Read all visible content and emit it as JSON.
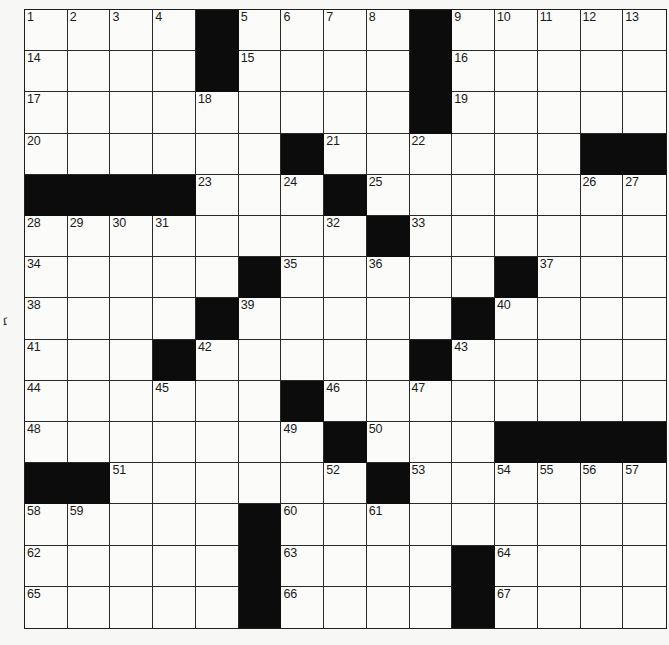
{
  "puzzle": {
    "type": "crossword",
    "rows": 15,
    "cols": 15,
    "colors": {
      "block": "#0c0c0c",
      "cell": "#fbfbf9",
      "grid_line": "#2a2a2a",
      "page": "#f7f7f5"
    },
    "grid": [
      [
        "1",
        "2",
        "3",
        "4",
        "#",
        "5",
        "6",
        "7",
        "8",
        "#",
        "9",
        "10",
        "11",
        "12",
        "13"
      ],
      [
        "14",
        "",
        "",
        "",
        "#",
        "15",
        "",
        "",
        "",
        "#",
        "16",
        "",
        "",
        "",
        ""
      ],
      [
        "17",
        "",
        "",
        "",
        "18",
        "",
        "",
        "",
        "",
        "#",
        "19",
        "",
        "",
        "",
        ""
      ],
      [
        "20",
        "",
        "",
        "",
        "",
        "",
        "#",
        "21",
        "",
        "22",
        "",
        "",
        "",
        "#",
        "#"
      ],
      [
        "#",
        "#",
        "#",
        "#",
        "23",
        "",
        "24",
        "#",
        "25",
        "",
        "",
        "",
        "",
        "26",
        "27"
      ],
      [
        "28",
        "29",
        "30",
        "31",
        "",
        "",
        "",
        "32",
        "#",
        "33",
        "",
        "",
        "",
        "",
        ""
      ],
      [
        "34",
        "",
        "",
        "",
        "",
        "#",
        "35",
        "",
        "36",
        "",
        "",
        "#",
        "37",
        "",
        ""
      ],
      [
        "38",
        "",
        "",
        "",
        "#",
        "39",
        "",
        "",
        "",
        "",
        "#",
        "40",
        "",
        "",
        ""
      ],
      [
        "41",
        "",
        "",
        "#",
        "42",
        "",
        "",
        "",
        "",
        "#",
        "43",
        "",
        "",
        "",
        ""
      ],
      [
        "44",
        "",
        "",
        "45",
        "",
        "",
        "#",
        "46",
        "",
        "47",
        "",
        "",
        "",
        "",
        ""
      ],
      [
        "48",
        "",
        "",
        "",
        "",
        "",
        "49",
        "#",
        "50",
        "",
        "",
        "#",
        "#",
        "#",
        "#"
      ],
      [
        "#",
        "#",
        "51",
        "",
        "",
        "",
        "",
        "52",
        "#",
        "53",
        "",
        "54",
        "55",
        "56",
        "57"
      ],
      [
        "58",
        "59",
        "",
        "",
        "",
        "#",
        "60",
        "",
        "61",
        "",
        "",
        "",
        "",
        "",
        ""
      ],
      [
        "62",
        "",
        "",
        "",
        "",
        "#",
        "63",
        "",
        "",
        "",
        "#",
        "64",
        "",
        "",
        ""
      ],
      [
        "65",
        "",
        "",
        "",
        "",
        "#",
        "66",
        "",
        "",
        "",
        "#",
        "67",
        "",
        "",
        ""
      ]
    ],
    "entries_filled": false
  },
  "margin_mark": "ɾ"
}
